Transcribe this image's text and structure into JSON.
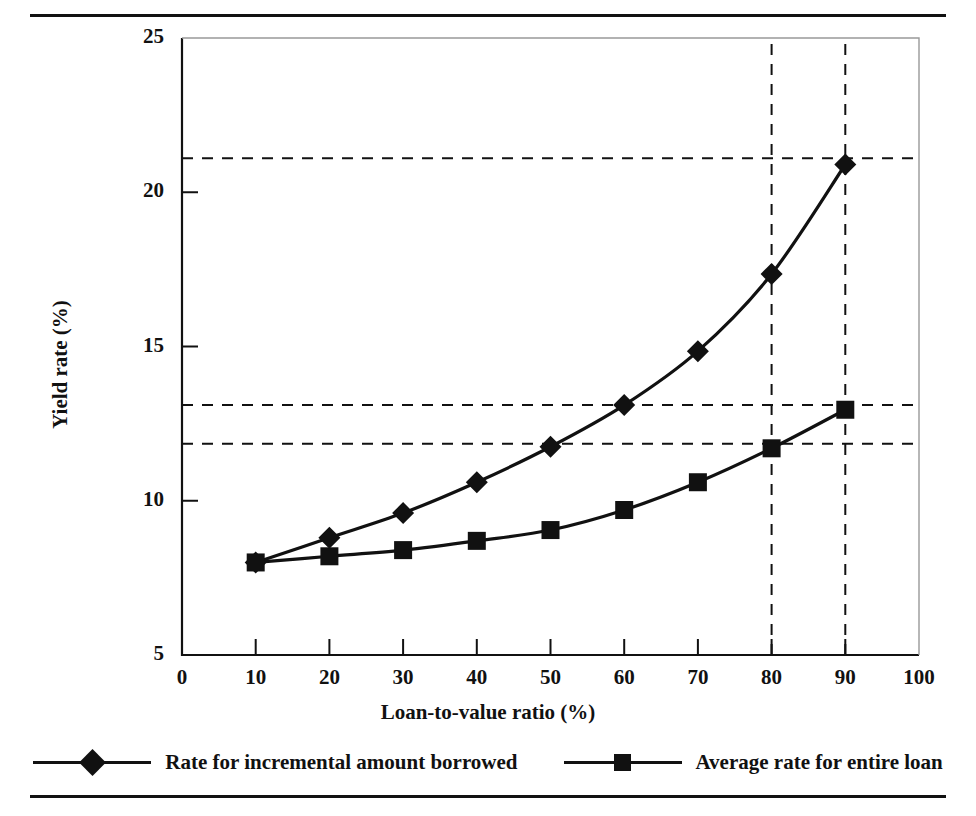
{
  "figure": {
    "top_rule": "horizontal-rule",
    "bottom_rule": "horizontal-rule"
  },
  "chart_data": {
    "type": "line",
    "title": "",
    "xlabel": "Loan-to-value ratio (%)",
    "ylabel": "Yield rate (%)",
    "xlim": [
      0,
      100
    ],
    "ylim": [
      5,
      25
    ],
    "xticks": [
      0,
      10,
      20,
      30,
      40,
      50,
      60,
      70,
      80,
      90,
      100
    ],
    "yticks": [
      5,
      10,
      15,
      20,
      25
    ],
    "xtick_labels": [
      "0",
      "10",
      "20",
      "30",
      "40",
      "50",
      "60",
      "70",
      "80",
      "90",
      "100"
    ],
    "ytick_labels": [
      "5",
      "10",
      "15",
      "20",
      "25"
    ],
    "grid": false,
    "legend_position": "below-plot",
    "x": [
      10,
      20,
      30,
      40,
      50,
      60,
      70,
      80,
      90
    ],
    "series": [
      {
        "name": "Rate for incremental amount borrowed",
        "marker": "diamond",
        "values": [
          8.0,
          8.8,
          9.6,
          10.6,
          11.75,
          13.1,
          14.85,
          17.35,
          20.9
        ]
      },
      {
        "name": "Average rate for entire loan",
        "marker": "square",
        "values": [
          8.0,
          8.2,
          8.4,
          8.7,
          9.05,
          9.7,
          10.6,
          11.7,
          12.95
        ]
      }
    ],
    "annotations": {
      "horizontal_reference_lines": [
        21.1,
        13.1,
        11.85
      ],
      "vertical_reference_lines": [
        80,
        90
      ]
    }
  },
  "legend": {
    "items": [
      {
        "label": "Rate for incremental amount borrowed",
        "marker": "diamond"
      },
      {
        "label": "Average rate for entire loan",
        "marker": "square"
      }
    ]
  },
  "colors": {
    "ink": "#111111",
    "background": "#ffffff"
  }
}
